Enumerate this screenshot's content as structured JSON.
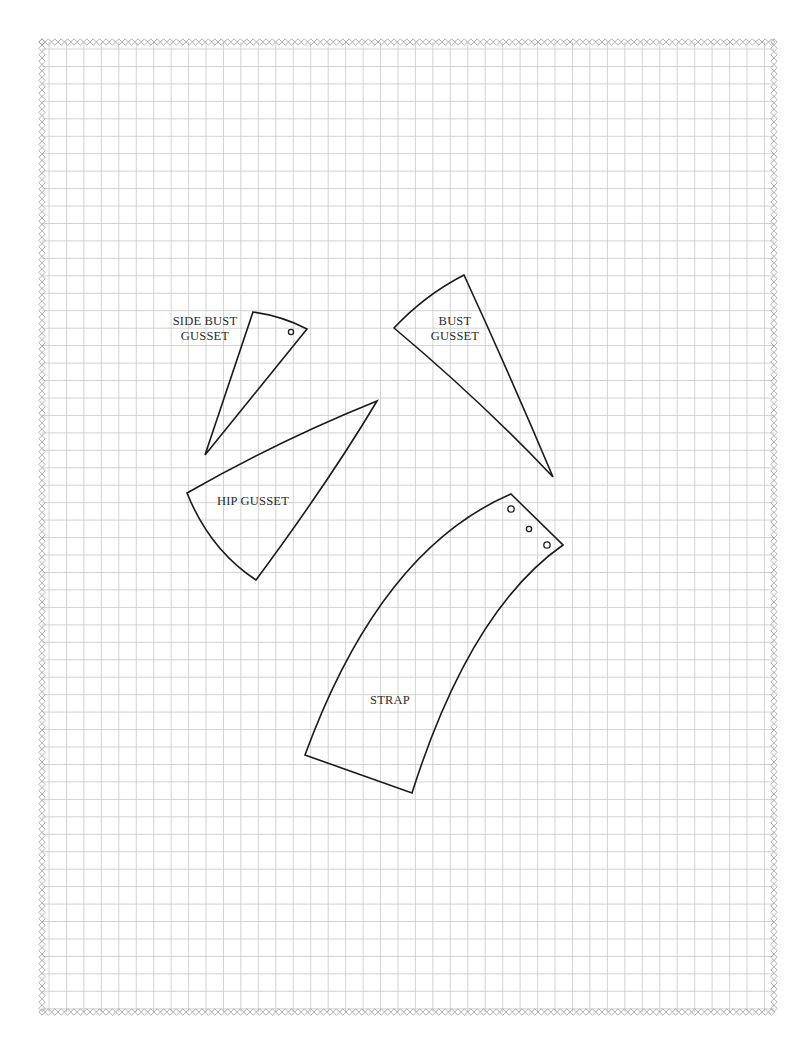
{
  "sheet": {
    "background": "#ffffff",
    "grid_color": "#c8c8c8",
    "border_color": "#9a9a9a",
    "line_color": "#1a1a1a",
    "grid_left": 42,
    "grid_top": 42,
    "grid_right": 774,
    "grid_bottom": 1012,
    "grid_spacing": 17.45
  },
  "pieces": [
    {
      "id": "side-bust-gusset",
      "label_line1": "SIDE BUST",
      "label_line2": "GUSSET",
      "points": [
        [
          253,
          312
        ],
        [
          307,
          329
        ],
        [
          205,
          455
        ]
      ],
      "holes": [
        [
          291,
          332
        ]
      ]
    },
    {
      "id": "bust-gusset",
      "label_line1": "BUST",
      "label_line2": "GUSSET",
      "points": [
        [
          464,
          275
        ],
        [
          394,
          328
        ],
        [
          553,
          477
        ]
      ],
      "holes": []
    },
    {
      "id": "hip-gusset",
      "label_line1": "HIP GUSSET",
      "points": [
        [
          377,
          401
        ],
        [
          187,
          493
        ],
        [
          256,
          580
        ]
      ],
      "holes": []
    },
    {
      "id": "strap",
      "label_line1": "STRAP",
      "points": [
        [
          511,
          494
        ],
        [
          563,
          545
        ],
        [
          412,
          793
        ],
        [
          305,
          755
        ]
      ],
      "holes": [
        [
          511,
          509
        ],
        [
          529,
          529
        ],
        [
          547,
          545
        ]
      ]
    }
  ]
}
